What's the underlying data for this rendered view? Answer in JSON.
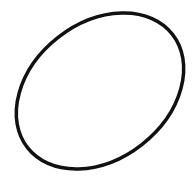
{
  "canvas": {
    "width": 196,
    "height": 177,
    "background": "#ffffff"
  },
  "shape": {
    "type": "ellipse",
    "label": "hand-drawn oval",
    "stroke_color": "#111111",
    "stroke_width": 3.5,
    "center": [
      100,
      91
    ],
    "rx": 92,
    "ry": 68,
    "rotation_deg": -38
  }
}
